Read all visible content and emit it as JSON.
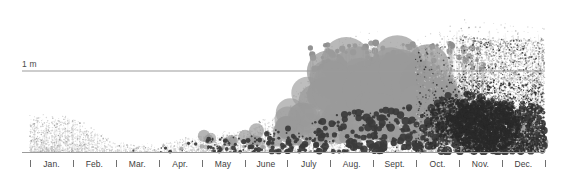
{
  "figure": {
    "title": "",
    "background_color": "#ffffff",
    "width": 565,
    "height": 176
  },
  "yaxis": {
    "reference_line_label": "1 m",
    "reference_line_color": "#9b9b9b",
    "reference_line_y_px": 71,
    "label_color": "#4a4a4a"
  },
  "xaxis": {
    "line_color": "#9b9b9b",
    "tick_color": "#6f6f6f",
    "label_color": "#3d3d3d",
    "months": [
      {
        "label": "Jan."
      },
      {
        "label": "Feb."
      },
      {
        "label": "Mar."
      },
      {
        "label": "Apr."
      },
      {
        "label": "May"
      },
      {
        "label": "June"
      },
      {
        "label": "July"
      },
      {
        "label": "Aug."
      },
      {
        "label": "Sept."
      },
      {
        "label": "Oct."
      },
      {
        "label": "Nov."
      },
      {
        "label": "Dec."
      }
    ],
    "tick_count": 13,
    "first_tick_x": 30,
    "tick_spacing": 42.9
  },
  "colors": {
    "stipple_light": "#c9c9c9",
    "stipple_mid": "#8d8d8d",
    "stipple_dark": "#2a2a2a",
    "bubble_gray": "#9a9a9a",
    "dot_dark": "#3a3a3a",
    "stem": "#bdbdbd",
    "gridline": "#9b9b9b"
  },
  "chart_data": {
    "type": "scatter",
    "title": "",
    "xlabel": "",
    "ylabel": "",
    "xlim": [
      0,
      12
    ],
    "ylim": [
      0,
      1.45
    ],
    "grid": false,
    "legend": "none",
    "annotations": [
      {
        "text": "1 m",
        "y_value": 1.0,
        "x_value": 0.0
      }
    ],
    "axis_tick_labels": [
      "Jan.",
      "Feb.",
      "Mar.",
      "Apr.",
      "May",
      "June",
      "July",
      "Aug.",
      "Sept.",
      "Oct.",
      "Nov.",
      "Dec."
    ],
    "series": [
      {
        "name": "light-stipple-cloud",
        "color": "#c9c9c9",
        "categories": [
          "Jan.",
          "Feb.",
          "Mar.",
          "Apr.",
          "May",
          "June",
          "July",
          "Aug.",
          "Sept.",
          "Oct.",
          "Nov.",
          "Dec."
        ],
        "max_height_m": [
          0.42,
          0.4,
          0.11,
          0.09,
          0.2,
          0.27,
          0.5,
          1.3,
          1.32,
          1.25,
          1.44,
          1.4
        ],
        "density": [
          0.72,
          0.58,
          0.1,
          0.12,
          0.3,
          0.38,
          0.55,
          0.7,
          0.72,
          0.66,
          0.92,
          0.88
        ]
      },
      {
        "name": "gray-bubbles",
        "color": "#9a9a9a",
        "categories": [
          "Jan.",
          "Feb.",
          "Mar.",
          "Apr.",
          "May",
          "June",
          "July",
          "Aug.",
          "Sept.",
          "Oct.",
          "Nov.",
          "Dec."
        ],
        "max_height_m": [
          0.0,
          0.0,
          0.0,
          0.03,
          0.2,
          0.24,
          0.52,
          1.05,
          1.06,
          1.08,
          0.72,
          0.4
        ],
        "max_bubble_diameter_px": [
          0,
          0,
          0,
          4,
          12,
          13,
          26,
          44,
          46,
          42,
          30,
          18
        ],
        "count": [
          0,
          0,
          0,
          4,
          22,
          30,
          60,
          85,
          95,
          88,
          55,
          28
        ]
      },
      {
        "name": "dark-dots",
        "color": "#3a3a3a",
        "categories": [
          "Jan.",
          "Feb.",
          "Mar.",
          "Apr.",
          "May",
          "June",
          "July",
          "Aug.",
          "Sept.",
          "Oct.",
          "Nov.",
          "Dec."
        ],
        "max_height_m": [
          0.0,
          0.0,
          0.01,
          0.04,
          0.16,
          0.2,
          0.3,
          0.46,
          0.54,
          0.6,
          0.76,
          0.62
        ],
        "count": [
          0,
          0,
          2,
          14,
          70,
          85,
          110,
          130,
          150,
          165,
          320,
          290
        ]
      }
    ]
  }
}
